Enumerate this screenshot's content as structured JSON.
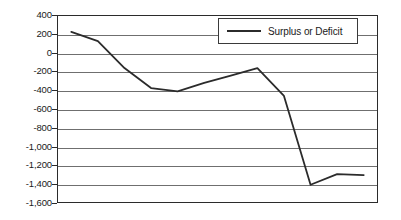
{
  "chart_data": {
    "type": "line",
    "title": "",
    "subtitle": "",
    "xlabel": "",
    "ylabel": "",
    "grid": true,
    "legend_position": "top-right-inside",
    "categories": [
      "2000",
      "2001",
      "2002",
      "2003",
      "2004",
      "2005",
      "2006",
      "2007",
      "2008",
      "2009",
      "2010",
      "2011"
    ],
    "series": [
      {
        "name": "Surplus or Deficit",
        "color": "#2b2b2b",
        "values": [
          230,
          130,
          -160,
          -375,
          -410,
          -320,
          -240,
          -160,
          -460,
          -1415,
          -1300,
          -1310
        ]
      }
    ],
    "ylim": [
      -1600,
      400
    ],
    "ytick_values": [
      400,
      200,
      0,
      -200,
      -400,
      -600,
      -800,
      -1000,
      -1200,
      -1400,
      -1600
    ],
    "ytick_labels": [
      "400",
      "200",
      "0",
      "-200",
      "-400",
      "-600",
      "-800",
      "-1,000",
      "-1,200",
      "-1,400",
      "-1,600"
    ]
  },
  "legend": {
    "entries": [
      {
        "label": "Surplus or Deficit"
      }
    ]
  }
}
